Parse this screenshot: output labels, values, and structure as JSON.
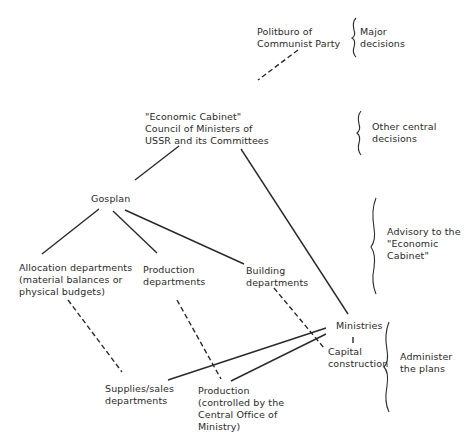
{
  "diagram": {
    "type": "organizational-hierarchy",
    "nodes": {
      "politburo": "Politburo of\nCommunist Party",
      "economic_cabinet": "\"Economic Cabinet\"\nCouncil of Ministers of\nUSSR and its Committees",
      "gosplan": "Gosplan",
      "allocation_departments": "Allocation departments\n(material balances or\nphysical budgets)",
      "production_departments": "Production\ndepartments",
      "building_departments": "Building\ndepartments",
      "ministries": "Ministries",
      "capital_construction": "Capital\nconstruction",
      "supplies_sales_departments": "Supplies/sales\ndepartments",
      "production_controlled": "Production\n(controlled by the\nCentral Office of\nMinistry)"
    },
    "levels": [
      {
        "label": "Major\ndecisions"
      },
      {
        "label": "Other central\ndecisions"
      },
      {
        "label": "Advisory to the\n\"Economic\nCabinet\""
      },
      {
        "label": "Administer\nthe plans"
      }
    ],
    "edges": [
      {
        "from": "politburo",
        "to": "economic_cabinet",
        "style": "dashed"
      },
      {
        "from": "economic_cabinet",
        "to": "gosplan",
        "style": "solid"
      },
      {
        "from": "economic_cabinet",
        "to": "ministries",
        "style": "solid"
      },
      {
        "from": "gosplan",
        "to": "allocation_departments",
        "style": "solid"
      },
      {
        "from": "gosplan",
        "to": "production_departments",
        "style": "solid"
      },
      {
        "from": "gosplan",
        "to": "building_departments",
        "style": "solid"
      },
      {
        "from": "allocation_departments",
        "to": "supplies_sales_departments",
        "style": "dashed"
      },
      {
        "from": "production_departments",
        "to": "production_controlled",
        "style": "dashed"
      },
      {
        "from": "building_departments",
        "to": "capital_construction",
        "style": "dashed"
      },
      {
        "from": "ministries",
        "to": "capital_construction",
        "style": "solid"
      },
      {
        "from": "ministries",
        "to": "supplies_sales_departments",
        "style": "solid"
      },
      {
        "from": "ministries",
        "to": "production_controlled",
        "style": "solid"
      }
    ]
  }
}
